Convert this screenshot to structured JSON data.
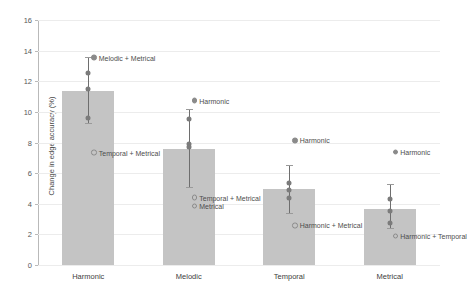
{
  "chart_data": {
    "type": "bar",
    "title": "",
    "xlabel": "",
    "ylabel": "Change in edge accuracy (%)",
    "ylim": [
      0,
      16
    ],
    "ytick_step": 2,
    "yticks": [
      0,
      2,
      4,
      6,
      8,
      10,
      12,
      14,
      16
    ],
    "grid": true,
    "legend": "none",
    "categories": [
      "Harmonic",
      "Melodic",
      "Temporal",
      "Metrical"
    ],
    "values": [
      11.35,
      7.55,
      4.95,
      3.65
    ],
    "bar_color": "#c4c4c4",
    "point_color": "#7b7b7b",
    "errorbar_color": "#6e6e6e",
    "error_bars": [
      {
        "category": "Harmonic",
        "low": 9.25,
        "high": 13.6
      },
      {
        "category": "Melodic",
        "low": 5.1,
        "high": 10.2
      },
      {
        "category": "Temporal",
        "low": 3.4,
        "high": 6.5
      },
      {
        "category": "Metrical",
        "low": 2.4,
        "high": 5.3
      }
    ],
    "points": [
      {
        "category": "Harmonic",
        "values": [
          12.7,
          11.65,
          9.75
        ]
      },
      {
        "category": "Melodic",
        "values": [
          9.7,
          8.05,
          7.85
        ]
      },
      {
        "category": "Temporal",
        "values": [
          5.5,
          5.05,
          4.55
        ]
      },
      {
        "category": "Metrical",
        "values": [
          4.5,
          3.7,
          2.9
        ]
      }
    ],
    "annotations": [
      {
        "category": "Harmonic",
        "text": "Melodic + Metrical",
        "y": 14.0,
        "marker": "filled"
      },
      {
        "category": "Harmonic",
        "text": "Temporal + Metrical",
        "y": 7.8,
        "marker": "open"
      },
      {
        "category": "Melodic",
        "text": "Harmonic",
        "y": 11.2,
        "marker": "filled"
      },
      {
        "category": "Melodic",
        "text": "Temporal + Metrical",
        "y": 4.85,
        "marker": "open"
      },
      {
        "category": "Melodic",
        "text": "Metrical",
        "y": 4.3,
        "marker": "open"
      },
      {
        "category": "Temporal",
        "text": "Harmonic",
        "y": 8.6,
        "marker": "filled"
      },
      {
        "category": "Temporal",
        "text": "Harmonic + Metrical",
        "y": 3.05,
        "marker": "open"
      },
      {
        "category": "Metrical",
        "text": "Harmonic",
        "y": 7.85,
        "marker": "filled"
      },
      {
        "category": "Metrical",
        "text": "Harmonic + Temporal",
        "y": 2.35,
        "marker": "open"
      }
    ]
  }
}
